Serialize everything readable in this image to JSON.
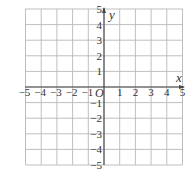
{
  "chart_data": {
    "type": "coordinate-grid",
    "title": "",
    "xlabel": "x",
    "ylabel": "y",
    "origin_label": "O",
    "xlim": [
      -5,
      5
    ],
    "ylim": [
      -5,
      5
    ],
    "grid": true,
    "x_ticks": [
      "-5",
      "-4",
      "-3",
      "-2",
      "-1",
      "1",
      "2",
      "3",
      "4",
      "5"
    ],
    "y_ticks": [
      "5",
      "4",
      "3",
      "2",
      "1",
      "-1",
      "-2",
      "-3",
      "-4",
      "-5"
    ],
    "x_tick_values": [
      -5,
      -4,
      -3,
      -2,
      -1,
      1,
      2,
      3,
      4,
      5
    ],
    "y_tick_values": [
      5,
      4,
      3,
      2,
      1,
      -1,
      -2,
      -3,
      -4,
      -5
    ],
    "series": []
  },
  "colors": {
    "grid": "#b8b8b8",
    "axis": "#444444",
    "text": "#333333"
  }
}
